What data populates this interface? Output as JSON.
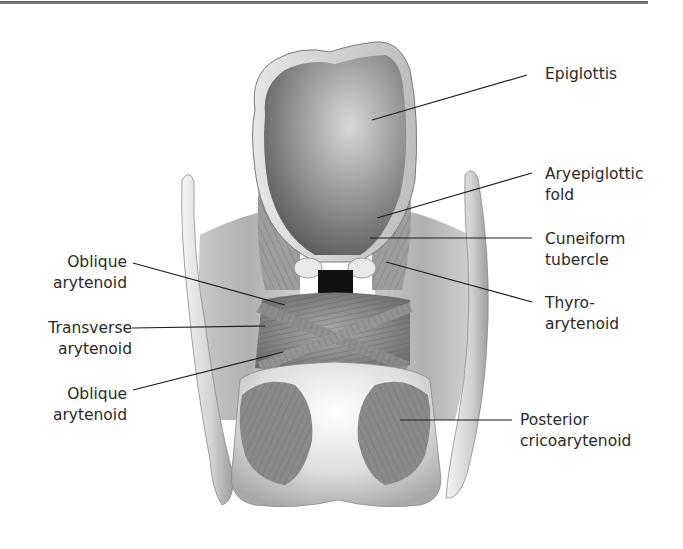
{
  "diagram": {
    "colors": {
      "top_rule": "#6e6e6e",
      "leader_line": "#1e1e1e",
      "label_text": "#2a2a2a",
      "background": "#ffffff"
    },
    "labels_right": [
      {
        "id": "epiglottis",
        "line1": "Epiglottis",
        "line2": ""
      },
      {
        "id": "aryepiglottic-fold",
        "line1": "Aryepiglottic",
        "line2": "fold"
      },
      {
        "id": "cuneiform-tubercle",
        "line1": "Cuneiform",
        "line2": "tubercle"
      },
      {
        "id": "thyro-arytenoid",
        "line1": "Thyro-",
        "line2": "arytenoid"
      },
      {
        "id": "posterior-cricoarytenoid",
        "line1": "Posterior",
        "line2": "cricoarytenoid"
      }
    ],
    "labels_left": [
      {
        "id": "oblique-arytenoid-upper",
        "line1": "Oblique",
        "line2": "arytenoid"
      },
      {
        "id": "transverse-arytenoid",
        "line1": "Transverse",
        "line2": "arytenoid"
      },
      {
        "id": "oblique-arytenoid-lower",
        "line1": "Oblique",
        "line2": "arytenoid"
      }
    ]
  }
}
